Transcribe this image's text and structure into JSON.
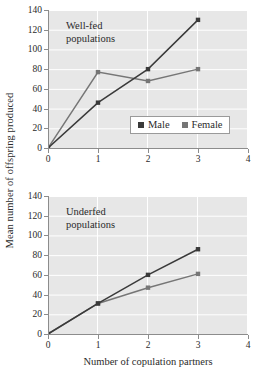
{
  "figure": {
    "ylabel": "Mean number of offspring produced",
    "xlabel": "Number of copulation partners"
  },
  "legend": {
    "male": {
      "label": "Male",
      "color": "#3a3a3a",
      "swatch": "male-legend-swatch"
    },
    "female": {
      "label": "Female",
      "color": "#767676",
      "swatch": "female-legend-swatch"
    }
  },
  "panels": [
    {
      "caption": "Well-fed\npopulations",
      "ytick_labels": [
        "0",
        "20",
        "40",
        "60",
        "80",
        "100",
        "120",
        "140"
      ],
      "xtick_labels": [
        "0",
        "1",
        "2",
        "3",
        "4"
      ]
    },
    {
      "caption": "Underfed\npopulations",
      "ytick_labels": [
        "0",
        "20",
        "40",
        "60",
        "80",
        "100",
        "120",
        "140"
      ],
      "xtick_labels": [
        "0",
        "1",
        "2",
        "3",
        "4"
      ]
    }
  ],
  "chart_data": [
    {
      "type": "line",
      "title": "Well-fed populations",
      "xlabel": "Number of copulation partners",
      "ylabel": "Mean number of offspring produced",
      "x": [
        0,
        1,
        2,
        3
      ],
      "xlim": [
        0,
        4
      ],
      "ylim": [
        0,
        140
      ],
      "xticks": [
        0,
        1,
        2,
        3,
        4
      ],
      "yticks": [
        0,
        20,
        40,
        60,
        80,
        100,
        120,
        140
      ],
      "grid": true,
      "legend_position": "inside-lower-right",
      "series": [
        {
          "name": "Male",
          "values": [
            0,
            46,
            80,
            130
          ],
          "color": "#3a3a3a",
          "marker": "square"
        },
        {
          "name": "Female",
          "values": [
            0,
            77,
            68,
            80
          ],
          "color": "#767676",
          "marker": "square"
        }
      ]
    },
    {
      "type": "line",
      "title": "Underfed populations",
      "xlabel": "Number of copulation partners",
      "ylabel": "Mean number of offspring produced",
      "x": [
        0,
        1,
        2,
        3
      ],
      "xlim": [
        0,
        4
      ],
      "ylim": [
        0,
        140
      ],
      "xticks": [
        0,
        1,
        2,
        3,
        4
      ],
      "yticks": [
        0,
        20,
        40,
        60,
        80,
        100,
        120,
        140
      ],
      "grid": true,
      "legend_position": "none",
      "series": [
        {
          "name": "Male",
          "values": [
            0,
            31,
            60,
            86
          ],
          "color": "#3a3a3a",
          "marker": "square"
        },
        {
          "name": "Female",
          "values": [
            0,
            31,
            47,
            61
          ],
          "color": "#767676",
          "marker": "square"
        }
      ]
    }
  ],
  "style": {
    "plot_background": "#e7e7e7",
    "gridline_color": "#ffffff",
    "axis_color": "#8c8c8c",
    "page_background": "#ffffff"
  }
}
